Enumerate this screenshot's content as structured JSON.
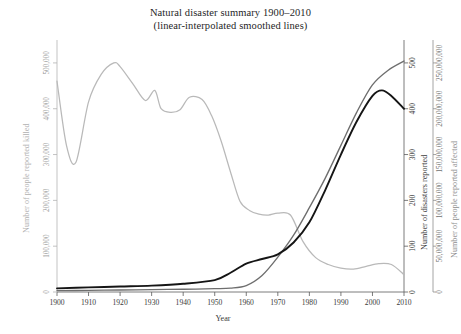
{
  "chart_data": {
    "type": "line",
    "title": "Natural disaster summary 1900–2010",
    "subtitle": "(linear-interpolated smoothed lines)",
    "xlabel": "Year",
    "xlim": [
      1900,
      2010
    ],
    "xticks": [
      1900,
      1910,
      1920,
      1930,
      1940,
      1950,
      1960,
      1970,
      1980,
      1990,
      2000,
      2010
    ],
    "grid": false,
    "legend": "none",
    "axes": [
      {
        "id": "left",
        "label": "Number of people reported killed",
        "position": "left",
        "lim": [
          0,
          550000
        ],
        "ticks": [
          0,
          100000,
          200000,
          300000,
          400000,
          500000
        ],
        "ticklabels": [
          "0",
          "100,000",
          "200,000",
          "300,000",
          "400,000",
          "500,000"
        ],
        "color": "#b9b9b9"
      },
      {
        "id": "right-inner",
        "label": "Number of disasters reported",
        "position": "right",
        "lim": [
          0,
          550
        ],
        "ticks": [
          0,
          100,
          200,
          300,
          400,
          500
        ],
        "ticklabels": [
          "0",
          "100",
          "200",
          "300",
          "400",
          "500"
        ],
        "color": "#151515"
      },
      {
        "id": "right-outer",
        "label": "Number of people reported affected",
        "position": "right-outer",
        "lim": [
          0,
          275000000
        ],
        "ticks": [
          0,
          50000000,
          100000000,
          150000000,
          200000000,
          250000000
        ],
        "ticklabels": [
          "0",
          "50,000,000",
          "100,000,000",
          "150,000,000",
          "200,000,000",
          "250,000,000"
        ],
        "color": "#6e6e6e"
      }
    ],
    "series": [
      {
        "name": "Number of people reported killed",
        "axis": "left",
        "color": "#b9b9b9",
        "x": [
          1900,
          1903,
          1906,
          1910,
          1914,
          1918,
          1920,
          1924,
          1928,
          1931,
          1933,
          1936,
          1939,
          1942,
          1946,
          1949,
          1952,
          1955,
          1958,
          1961,
          1964,
          1967,
          1970,
          1974,
          1978,
          1982,
          1986,
          1990,
          1994,
          1998,
          2002,
          2006,
          2010
        ],
        "values": [
          460000,
          320000,
          283000,
          415000,
          475000,
          500000,
          492000,
          455000,
          418000,
          440000,
          400000,
          392000,
          398000,
          425000,
          420000,
          385000,
          330000,
          262000,
          198000,
          178000,
          170000,
          168000,
          172000,
          168000,
          110000,
          75000,
          60000,
          52000,
          50000,
          56000,
          62000,
          60000,
          38000
        ]
      },
      {
        "name": "Number of people reported affected",
        "axis": "right-outer",
        "color": "#6e6e6e",
        "x": [
          1900,
          1910,
          1920,
          1930,
          1940,
          1950,
          1955,
          1960,
          1965,
          1970,
          1975,
          1980,
          1985,
          1990,
          1995,
          2000,
          2005,
          2010
        ],
        "values": [
          1500000,
          1800000,
          2200000,
          2600000,
          3000000,
          3600000,
          4200000,
          7000000,
          18000000,
          38000000,
          62000000,
          92000000,
          124000000,
          160000000,
          196000000,
          226000000,
          242000000,
          252000000
        ]
      },
      {
        "name": "Number of disasters reported",
        "axis": "right-inner",
        "color": "#151515",
        "x": [
          1900,
          1910,
          1920,
          1930,
          1940,
          1950,
          1955,
          1960,
          1965,
          1970,
          1975,
          1980,
          1985,
          1990,
          1995,
          2000,
          2003,
          2006,
          2010
        ],
        "values": [
          8,
          10,
          12,
          14,
          18,
          26,
          42,
          62,
          72,
          82,
          108,
          152,
          222,
          300,
          372,
          428,
          440,
          428,
          400
        ]
      }
    ]
  }
}
